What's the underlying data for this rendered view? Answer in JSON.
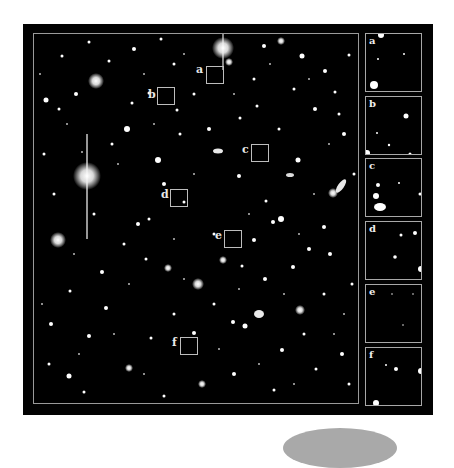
{
  "figure": {
    "background": "#ffffff",
    "panel_color": "#020202",
    "frame_color": "#9a9a9a",
    "main_field": {
      "description": "deep-field astronomical image with stars and galaxies",
      "regions": [
        {
          "id": "a",
          "label": "a",
          "x": 172,
          "y": 32
        },
        {
          "id": "b",
          "label": "b",
          "x": 123,
          "y": 53
        },
        {
          "id": "c",
          "label": "c",
          "x": 217,
          "y": 110
        },
        {
          "id": "d",
          "label": "d",
          "x": 136,
          "y": 155
        },
        {
          "id": "e",
          "label": "e",
          "x": 190,
          "y": 196
        },
        {
          "id": "f",
          "label": "f",
          "x": 146,
          "y": 303
        }
      ]
    },
    "insets": [
      {
        "label": "a",
        "top": 9
      },
      {
        "label": "b",
        "top": 72
      },
      {
        "label": "c",
        "top": 134
      },
      {
        "label": "d",
        "top": 197
      },
      {
        "label": "e",
        "top": 260
      },
      {
        "label": "f",
        "top": 323
      }
    ]
  }
}
